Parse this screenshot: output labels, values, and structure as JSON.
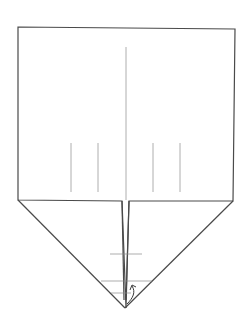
{
  "diagram": {
    "type": "origami-fold-step",
    "colors": {
      "outline": "#4a4a4a",
      "crease": "#9a9a9a",
      "background": "#ffffff"
    },
    "elements": [
      {
        "name": "paper-outline",
        "kind": "outline"
      },
      {
        "name": "center-crease",
        "kind": "crease"
      },
      {
        "name": "vertical-crease-marks",
        "kind": "crease",
        "count": 4
      },
      {
        "name": "center-slit",
        "kind": "outline"
      },
      {
        "name": "horizontal-guide-lines",
        "kind": "guide",
        "count": 3
      },
      {
        "name": "fold-arrow",
        "kind": "arrow"
      }
    ]
  }
}
